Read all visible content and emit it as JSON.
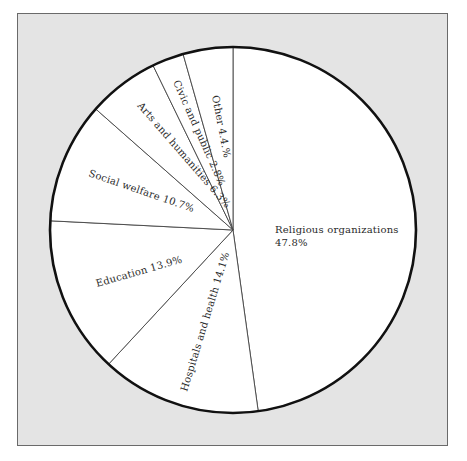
{
  "chart_data": {
    "type": "pie",
    "title": "",
    "center": [
      233,
      230
    ],
    "radius": 183,
    "start_angle_deg": -90,
    "direction": "clockwise",
    "categories": [
      "Religious organizations",
      "Hospitals and health",
      "Education",
      "Social welfare",
      "Arts and humanities",
      "Civic and public",
      "Other"
    ],
    "values": [
      47.8,
      14.1,
      13.9,
      10.7,
      6.3,
      2.8,
      4.4
    ],
    "unit": "%",
    "labels": {
      "religious_line1": "Religious organizations",
      "religious_line2": "47.8%",
      "hospitals": "Hospitals and health  14.1%",
      "education": "Education 13.9%",
      "social": "Social welfare 10.7%",
      "arts": "Arts and humanities 6.3%",
      "civic": "Civic and public 2.8%",
      "other": "Other 4.4.%"
    },
    "legend": "none",
    "grid": false
  },
  "colors": {
    "background": "#ffffff",
    "frame": "#e4e4e4",
    "frame_border": "#6a6a6a",
    "slice_fill": "#ffffff",
    "outline": "#111111",
    "divider": "#444444",
    "text": "#2a2a2a"
  }
}
